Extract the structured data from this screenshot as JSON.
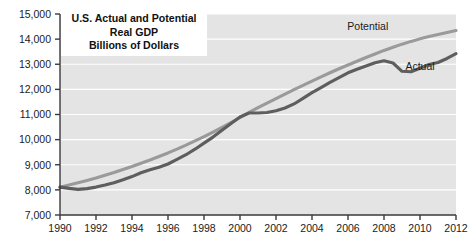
{
  "title": {
    "line1": "U.S. Actual and Potential",
    "line2": "Real GDP",
    "line3": "Billions of Dollars"
  },
  "chart_data": {
    "type": "line",
    "title": "U.S. Actual and Potential Real GDP Billions of Dollars",
    "xlabel": "",
    "ylabel": "",
    "xlim": [
      1990,
      2012
    ],
    "ylim": [
      7000,
      15000
    ],
    "grid": true,
    "legend_position": "inline-annotations",
    "y_ticks": [
      "7,000",
      "8,000",
      "9,000",
      "10,000",
      "11,000",
      "12,000",
      "13,000",
      "14,000",
      "15,000"
    ],
    "y_tick_values": [
      7000,
      8000,
      9000,
      10000,
      11000,
      12000,
      13000,
      14000,
      15000
    ],
    "x_ticks": [
      "1990",
      "1992",
      "1994",
      "1996",
      "1998",
      "2000",
      "2002",
      "2004",
      "2006",
      "2008",
      "2010",
      "2012"
    ],
    "x_tick_values": [
      1990,
      1992,
      1994,
      1996,
      1998,
      2000,
      2002,
      2004,
      2006,
      2008,
      2010,
      2012
    ],
    "x": [
      1990,
      1990.5,
      1991,
      1991.5,
      1992,
      1992.5,
      1993,
      1993.5,
      1994,
      1994.5,
      1995,
      1995.5,
      1996,
      1996.5,
      1997,
      1997.5,
      1998,
      1998.5,
      1999,
      1999.5,
      2000,
      2000.5,
      2001,
      2001.5,
      2002,
      2002.5,
      2003,
      2003.5,
      2004,
      2004.5,
      2005,
      2005.5,
      2006,
      2006.5,
      2007,
      2007.5,
      2008,
      2008.5,
      2009,
      2009.5,
      2010,
      2010.5,
      2011,
      2011.5,
      2012
    ],
    "series": [
      {
        "name": "Potential",
        "color": "#9a9a9a",
        "label_x": 2007.1,
        "label_y": 14360,
        "values": [
          8100,
          8190,
          8280,
          8370,
          8470,
          8580,
          8690,
          8810,
          8930,
          9060,
          9190,
          9330,
          9470,
          9620,
          9780,
          9950,
          10120,
          10300,
          10490,
          10680,
          10880,
          11080,
          11270,
          11450,
          11630,
          11810,
          11990,
          12160,
          12330,
          12500,
          12660,
          12820,
          12970,
          13120,
          13270,
          13410,
          13550,
          13680,
          13800,
          13910,
          14010,
          14100,
          14180,
          14260,
          14340
        ]
      },
      {
        "name": "Actual",
        "color": "#5e5e5e",
        "label_x": 2010.0,
        "label_y": 12780,
        "values": [
          8110,
          8060,
          8020,
          8050,
          8110,
          8190,
          8280,
          8400,
          8530,
          8680,
          8800,
          8900,
          9030,
          9210,
          9400,
          9620,
          9860,
          10100,
          10370,
          10640,
          10900,
          11060,
          11060,
          11080,
          11150,
          11260,
          11420,
          11640,
          11870,
          12070,
          12280,
          12470,
          12660,
          12800,
          12930,
          13060,
          13140,
          13050,
          12720,
          12700,
          12840,
          12990,
          13070,
          13230,
          13420
        ]
      }
    ]
  },
  "axes": {
    "y_axis_name": "y-axis",
    "x_axis_name": "x-axis"
  }
}
